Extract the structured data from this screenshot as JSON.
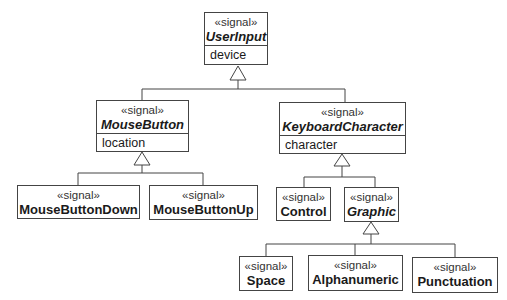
{
  "diagram": {
    "type": "UML class diagram (signal generalization hierarchy)",
    "stereotype": "«signal»",
    "classes": [
      {
        "id": "UserInput",
        "name": "UserInput",
        "abstract": true,
        "attributes": [
          "device"
        ]
      },
      {
        "id": "MouseButton",
        "name": "MouseButton",
        "abstract": true,
        "attributes": [
          "location"
        ],
        "parent": "UserInput"
      },
      {
        "id": "KeyboardCharacter",
        "name": "KeyboardCharacter",
        "abstract": true,
        "attributes": [
          "character"
        ],
        "parent": "UserInput"
      },
      {
        "id": "MouseButtonDown",
        "name": "MouseButtonDown",
        "abstract": false,
        "attributes": [],
        "parent": "MouseButton"
      },
      {
        "id": "MouseButtonUp",
        "name": "MouseButtonUp",
        "abstract": false,
        "attributes": [],
        "parent": "MouseButton"
      },
      {
        "id": "Control",
        "name": "Control",
        "abstract": false,
        "attributes": [],
        "parent": "KeyboardCharacter"
      },
      {
        "id": "Graphic",
        "name": "Graphic",
        "abstract": true,
        "attributes": [],
        "parent": "KeyboardCharacter"
      },
      {
        "id": "Space",
        "name": "Space",
        "abstract": false,
        "attributes": [],
        "parent": "Graphic"
      },
      {
        "id": "Alphanumeric",
        "name": "Alphanumeric",
        "abstract": false,
        "attributes": [],
        "parent": "Graphic"
      },
      {
        "id": "Punctuation",
        "name": "Punctuation",
        "abstract": false,
        "attributes": [],
        "parent": "Graphic"
      }
    ]
  },
  "labels": {
    "stereotype": "«signal»",
    "userinput": {
      "name": "UserInput",
      "attr": "device"
    },
    "mousebutton": {
      "name": "MouseButton",
      "attr": "location"
    },
    "keyboardcharacter": {
      "name": "KeyboardCharacter",
      "attr": "character"
    },
    "mousebuttondown": {
      "name": "MouseButtonDown"
    },
    "mousebuttonup": {
      "name": "MouseButtonUp"
    },
    "control": {
      "name": "Control"
    },
    "graphic": {
      "name": "Graphic"
    },
    "space": {
      "name": "Space"
    },
    "alphanumeric": {
      "name": "Alphanumeric"
    },
    "punctuation": {
      "name": "Punctuation"
    }
  },
  "colors": {
    "line": "#444444",
    "text": "#1a1a1a",
    "background": "#ffffff"
  }
}
